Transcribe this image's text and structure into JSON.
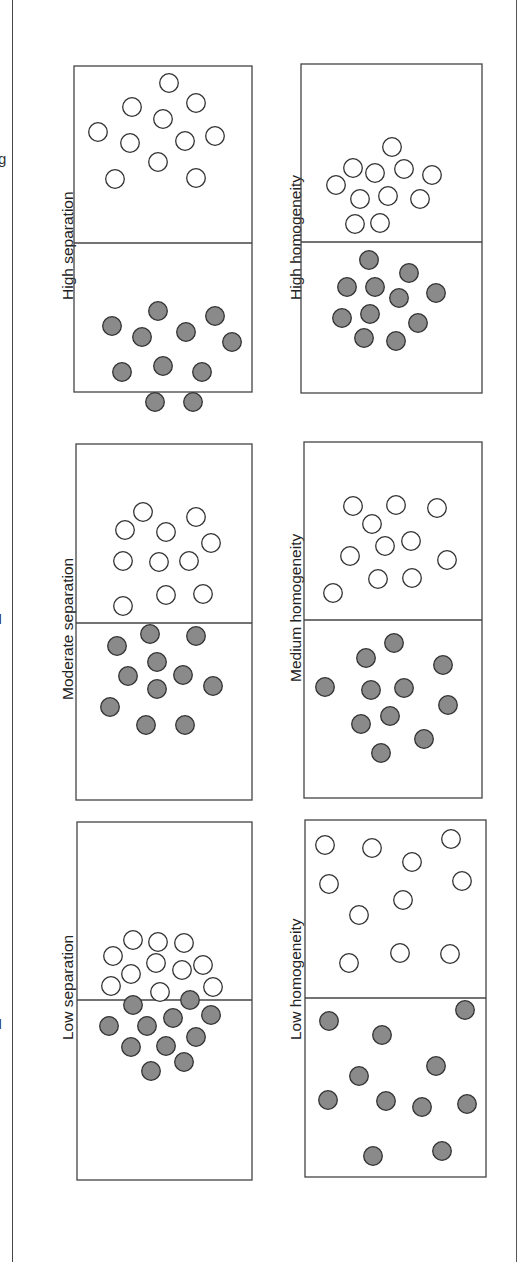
{
  "figure": {
    "orientation": "rotated-90-ccw",
    "colors": {
      "filled": "#8a8a8a",
      "outline": "#333333",
      "hollow": "#ffffff",
      "border": "#444444"
    },
    "panels": [
      {
        "id": "high-separation",
        "label": "High separation",
        "box": {
          "x": 74,
          "y": 66,
          "w": 178,
          "h": 326
        },
        "divider_y": 243,
        "label_pos": {
          "x": 38,
          "y": 300
        },
        "hollow": [
          [
            169,
            83
          ],
          [
            132,
            107
          ],
          [
            196,
            103
          ],
          [
            163,
            119
          ],
          [
            98,
            132
          ],
          [
            130,
            143
          ],
          [
            185,
            141
          ],
          [
            215,
            136
          ],
          [
            158,
            162
          ],
          [
            115,
            179
          ],
          [
            196,
            178
          ]
        ],
        "filled": [
          [
            158,
            311
          ],
          [
            112,
            326
          ],
          [
            142,
            337
          ],
          [
            186,
            332
          ],
          [
            215,
            316
          ],
          [
            232,
            342
          ],
          [
            122,
            372
          ],
          [
            163,
            366
          ],
          [
            202,
            372
          ],
          [
            155,
            402
          ],
          [
            193,
            402
          ]
        ]
      },
      {
        "id": "high-homogeneity",
        "label": "High homogeneity",
        "box": {
          "x": 301,
          "y": 64,
          "w": 181,
          "h": 329
        },
        "divider_y": 242,
        "label_pos": {
          "x": 266,
          "y": 300
        },
        "hollow": [
          [
            392,
            147
          ],
          [
            353,
            168
          ],
          [
            375,
            173
          ],
          [
            404,
            169
          ],
          [
            432,
            175
          ],
          [
            336,
            185
          ],
          [
            360,
            199
          ],
          [
            388,
            196
          ],
          [
            420,
            199
          ],
          [
            355,
            224
          ],
          [
            380,
            223
          ]
        ],
        "filled": [
          [
            369,
            260
          ],
          [
            347,
            287
          ],
          [
            375,
            287
          ],
          [
            409,
            273
          ],
          [
            399,
            298
          ],
          [
            436,
            293
          ],
          [
            370,
            314
          ],
          [
            342,
            318
          ],
          [
            418,
            323
          ],
          [
            364,
            338
          ],
          [
            396,
            341
          ]
        ]
      },
      {
        "id": "moderate-separation",
        "label": "Moderate separation",
        "box": {
          "x": 76,
          "y": 444,
          "w": 176,
          "h": 356
        },
        "divider_y": 623,
        "label_pos": {
          "x": 38,
          "y": 700
        },
        "hollow": [
          [
            143,
            512
          ],
          [
            125,
            530
          ],
          [
            166,
            532
          ],
          [
            196,
            517
          ],
          [
            211,
            543
          ],
          [
            123,
            561
          ],
          [
            159,
            562
          ],
          [
            189,
            561
          ],
          [
            203,
            594
          ],
          [
            166,
            595
          ],
          [
            123,
            606
          ]
        ],
        "filled": [
          [
            150,
            634
          ],
          [
            196,
            636
          ],
          [
            117,
            646
          ],
          [
            157,
            662
          ],
          [
            128,
            676
          ],
          [
            183,
            675
          ],
          [
            157,
            689
          ],
          [
            213,
            686
          ],
          [
            110,
            707
          ],
          [
            146,
            725
          ],
          [
            185,
            725
          ]
        ]
      },
      {
        "id": "medium-homogeneity",
        "label": "Medium homogeneity",
        "box": {
          "x": 304,
          "y": 442,
          "w": 178,
          "h": 356
        },
        "divider_y": 620,
        "label_pos": {
          "x": 266,
          "y": 682
        },
        "hollow": [
          [
            353,
            506
          ],
          [
            396,
            505
          ],
          [
            437,
            508
          ],
          [
            372,
            524
          ],
          [
            385,
            546
          ],
          [
            411,
            541
          ],
          [
            350,
            556
          ],
          [
            447,
            560
          ],
          [
            378,
            579
          ],
          [
            412,
            578
          ],
          [
            333,
            593
          ]
        ],
        "filled": [
          [
            394,
            643
          ],
          [
            366,
            658
          ],
          [
            443,
            665
          ],
          [
            325,
            687
          ],
          [
            371,
            690
          ],
          [
            404,
            688
          ],
          [
            448,
            705
          ],
          [
            390,
            716
          ],
          [
            361,
            724
          ],
          [
            424,
            739
          ],
          [
            381,
            753
          ]
        ]
      },
      {
        "id": "low-separation",
        "label": "Low separation",
        "box": {
          "x": 77,
          "y": 822,
          "w": 175,
          "h": 358
        },
        "divider_y": 1000,
        "label_pos": {
          "x": 38,
          "y": 1040
        },
        "hollow": [
          [
            133,
            940
          ],
          [
            158,
            942
          ],
          [
            184,
            943
          ],
          [
            113,
            956
          ],
          [
            131,
            974
          ],
          [
            156,
            963
          ],
          [
            182,
            970
          ],
          [
            203,
            965
          ],
          [
            111,
            986
          ],
          [
            160,
            992
          ],
          [
            213,
            987
          ]
        ],
        "filled": [
          [
            133,
            1005
          ],
          [
            190,
            1000
          ],
          [
            109,
            1026
          ],
          [
            147,
            1026
          ],
          [
            173,
            1018
          ],
          [
            211,
            1015
          ],
          [
            196,
            1037
          ],
          [
            131,
            1047
          ],
          [
            166,
            1046
          ],
          [
            184,
            1062
          ],
          [
            151,
            1071
          ]
        ]
      },
      {
        "id": "low-homogeneity",
        "label": "Low homogeneity",
        "box": {
          "x": 305,
          "y": 820,
          "w": 181,
          "h": 357
        },
        "divider_y": 998,
        "label_pos": {
          "x": 266,
          "y": 1040
        },
        "hollow": [
          [
            325,
            845
          ],
          [
            372,
            848
          ],
          [
            412,
            862
          ],
          [
            451,
            839
          ],
          [
            329,
            884
          ],
          [
            462,
            881
          ],
          [
            403,
            900
          ],
          [
            359,
            915
          ],
          [
            400,
            953
          ],
          [
            349,
            963
          ],
          [
            450,
            954
          ]
        ],
        "filled": [
          [
            329,
            1021
          ],
          [
            382,
            1035
          ],
          [
            465,
            1010
          ],
          [
            436,
            1066
          ],
          [
            359,
            1076
          ],
          [
            328,
            1100
          ],
          [
            386,
            1101
          ],
          [
            422,
            1107
          ],
          [
            467,
            1104
          ],
          [
            373,
            1156
          ],
          [
            442,
            1151
          ]
        ]
      }
    ],
    "caption_fragments": [
      "g",
      "I",
      "I"
    ]
  },
  "chart_data": {
    "type": "scatter",
    "title": "",
    "panels": [
      {
        "label": "High separation",
        "series": [
          {
            "name": "hollow",
            "count": 11
          },
          {
            "name": "filled",
            "count": 11
          }
        ]
      },
      {
        "label": "Moderate separation",
        "series": [
          {
            "name": "hollow",
            "count": 11
          },
          {
            "name": "filled",
            "count": 11
          }
        ]
      },
      {
        "label": "Low separation",
        "series": [
          {
            "name": "hollow",
            "count": 11
          },
          {
            "name": "filled",
            "count": 11
          }
        ]
      },
      {
        "label": "High homogeneity",
        "series": [
          {
            "name": "hollow",
            "count": 11
          },
          {
            "name": "filled",
            "count": 11
          }
        ]
      },
      {
        "label": "Medium homogeneity",
        "series": [
          {
            "name": "hollow",
            "count": 11
          },
          {
            "name": "filled",
            "count": 11
          }
        ]
      },
      {
        "label": "Low homogeneity",
        "series": [
          {
            "name": "hollow",
            "count": 11
          },
          {
            "name": "filled",
            "count": 11
          }
        ]
      }
    ]
  }
}
